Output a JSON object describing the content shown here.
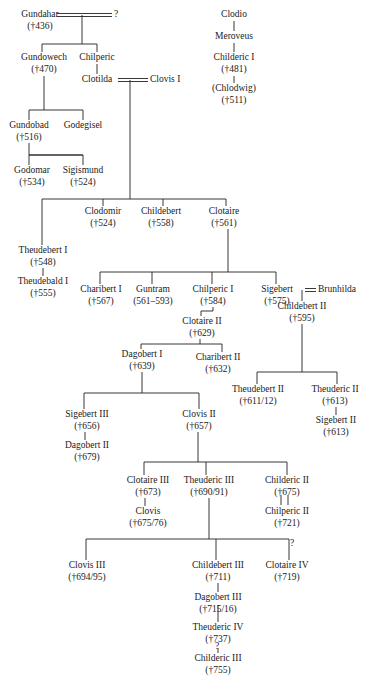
{
  "line_color": "#222222",
  "persons": {
    "gundahar": {
      "name": "Gundahar",
      "date": "(†436)"
    },
    "gundahar_spouse": {
      "name": "?",
      "date": ""
    },
    "clodio": {
      "name": "Clodio",
      "date": ""
    },
    "meroveus": {
      "name": "Meroveus",
      "date": ""
    },
    "childeric1": {
      "name": "Childeric I",
      "date": "(†481)"
    },
    "chlodwig": {
      "name": "(Chlodwig)",
      "date": "(†511)"
    },
    "gundowech": {
      "name": "Gundowech",
      "date": "(†470)"
    },
    "chilperic": {
      "name": "Chilperic",
      "date": ""
    },
    "clotilda": {
      "name": "Clotilda",
      "date": ""
    },
    "clovis1": {
      "name": "Clovis I",
      "date": ""
    },
    "gundobad": {
      "name": "Gundobad",
      "date": "(†516)"
    },
    "godegisel": {
      "name": "Godegisel",
      "date": ""
    },
    "godomar": {
      "name": "Godomar",
      "date": "(†534)"
    },
    "sigismund": {
      "name": "Sigismund",
      "date": "(†524)"
    },
    "theudebert1": {
      "name": "Theudebert I",
      "date": "(†548)"
    },
    "clodomir": {
      "name": "Clodomir",
      "date": "(†524)"
    },
    "childebert": {
      "name": "Childebert",
      "date": "(†558)"
    },
    "clotaire": {
      "name": "Clotaire",
      "date": "(†561)"
    },
    "theudebald1": {
      "name": "Theudebald I",
      "date": "(†555)"
    },
    "charibert1": {
      "name": "Charibert I",
      "date": "(†567)"
    },
    "guntram": {
      "name": "Guntram",
      "date": "(561–593)"
    },
    "chilperic1": {
      "name": "Chilperic I",
      "date": "(†584)"
    },
    "sigebert": {
      "name": "Sigebert",
      "date": "(†575)"
    },
    "brunhilda": {
      "name": "Brunhilda",
      "date": ""
    },
    "clotaire2": {
      "name": "Clotaire II",
      "date": "(†629)"
    },
    "childebert2": {
      "name": "Childebert II",
      "date": "(†595)"
    },
    "dagobert1": {
      "name": "Dagobert I",
      "date": "(†639)"
    },
    "charibert2": {
      "name": "Charibert II",
      "date": "(†632)"
    },
    "theudebert2": {
      "name": "Theudebert II",
      "date": "(†611/12)"
    },
    "theuderic2": {
      "name": "Theuderic II",
      "date": "(†613)"
    },
    "sigebert2": {
      "name": "Sigebert II",
      "date": "(†613)"
    },
    "sigebert3": {
      "name": "Sigebert III",
      "date": "(†656)"
    },
    "clovis2": {
      "name": "Clovis II",
      "date": "(†657)"
    },
    "dagobert2": {
      "name": "Dagobert II",
      "date": "(†679)"
    },
    "clotaire3": {
      "name": "Clotaire III",
      "date": "(†673)"
    },
    "theuderic3": {
      "name": "Theuderic III",
      "date": "(†690/91)"
    },
    "childeric2": {
      "name": "Childeric II",
      "date": "(†675)"
    },
    "clovis": {
      "name": "Clovis",
      "date": "(†675/76)"
    },
    "chilperic2": {
      "name": "Chilperic II",
      "date": "(†721)"
    },
    "clovis3": {
      "name": "Clovis III",
      "date": "(†694/95)"
    },
    "childebert3": {
      "name": "Childebert III",
      "date": "(†711)"
    },
    "clotaire4": {
      "name": "Clotaire IV",
      "date": "(†719)"
    },
    "dagobert3": {
      "name": "Dagobert III",
      "date": "(†715/16)"
    },
    "theuderic4": {
      "name": "Theuderic IV",
      "date": "(†737)"
    },
    "childeric3": {
      "name": "Childeric III",
      "date": "(†755)"
    }
  },
  "uncertain_marks": {
    "clotaire4_link": "?",
    "childeric3_link": "?"
  }
}
